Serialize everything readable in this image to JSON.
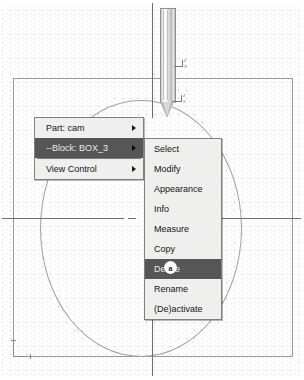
{
  "application": {
    "kind": "cad-viewport",
    "background_color": "#ffffff",
    "grid_dot_color": "#b9b9b9",
    "line_color": "#9a9a9a"
  },
  "viewport": {
    "part_outline_name": "part-bounding-rectangle",
    "circle_name": "circular-profile",
    "centerline_horizontal": "horizontal-centerline",
    "centerline_vertical": "vertical-centerline",
    "tool": {
      "name": "cutting-tool",
      "axis_labels": [
        "Z",
        "X",
        "Z",
        "X"
      ]
    }
  },
  "context_menu": {
    "name": "primary-context-menu",
    "selected_index": 1,
    "items": [
      {
        "label": "Part: cam",
        "has_submenu": true,
        "selected": false
      },
      {
        "label": "--Block: BOX_3",
        "has_submenu": true,
        "selected": true
      },
      {
        "label": "View Control",
        "has_submenu": true,
        "selected": false
      }
    ]
  },
  "submenu": {
    "name": "block-submenu",
    "selected_index": 6,
    "items": [
      {
        "label": "Select",
        "selected": false
      },
      {
        "label": "Modify",
        "selected": false
      },
      {
        "label": "Appearance",
        "selected": false
      },
      {
        "label": "Info",
        "selected": false
      },
      {
        "label": "Measure",
        "selected": false
      },
      {
        "label": "Copy",
        "selected": false
      },
      {
        "label": "Delete",
        "selected": true
      },
      {
        "label": "Rename",
        "selected": false
      },
      {
        "label": "(De)activate",
        "selected": false
      }
    ]
  },
  "cursor": {
    "name": "mouse-pointer",
    "glyph": "a"
  },
  "colors": {
    "menu_background": "#f0f0ee",
    "menu_border": "#808080",
    "menu_text": "#141414",
    "highlight_background": "#565656",
    "highlight_text": "#ececec"
  }
}
